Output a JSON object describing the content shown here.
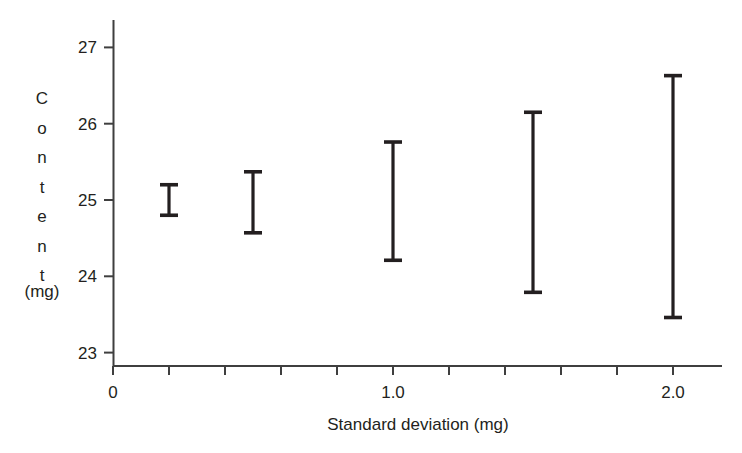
{
  "chart_data": {
    "type": "errorbar",
    "title": "",
    "subtitle": "",
    "xlabel": "Standard deviation (mg)",
    "ylabel": "Content",
    "ylabel_units": "(mg)",
    "ylabel_letters": [
      "C",
      "o",
      "n",
      "t",
      "e",
      "n",
      "t"
    ],
    "xlim": [
      0,
      2.2
    ],
    "ylim": [
      22.8,
      27.3
    ],
    "grid": false,
    "legend": null,
    "x_tick_labels": [
      "0",
      "1.0",
      "2.0"
    ],
    "x_tick_label_values": [
      0,
      1.0,
      2.0
    ],
    "x_minor_tick_values": [
      0,
      0.2,
      0.4,
      0.6,
      0.8,
      1.0,
      1.2,
      1.4,
      1.6,
      1.8,
      2.0
    ],
    "y_tick_labels": [
      "23",
      "24",
      "25",
      "26",
      "27"
    ],
    "y_tick_values": [
      23,
      24,
      25,
      26,
      27
    ],
    "x": [
      0.2,
      0.5,
      1.0,
      1.5,
      2.0
    ],
    "lower": [
      24.8,
      24.57,
      24.21,
      23.79,
      23.46
    ],
    "upper": [
      25.2,
      25.37,
      25.76,
      26.15,
      26.63
    ],
    "center": [
      25.0,
      24.97,
      24.99,
      24.97,
      25.05
    ],
    "series": [
      {
        "name": "Content interval",
        "points": [
          {
            "sd": 0.2,
            "low": 24.8,
            "high": 25.2
          },
          {
            "sd": 0.5,
            "low": 24.57,
            "high": 25.37
          },
          {
            "sd": 1.0,
            "low": 24.21,
            "high": 25.76
          },
          {
            "sd": 1.5,
            "low": 23.79,
            "high": 26.15
          },
          {
            "sd": 2.0,
            "low": 23.46,
            "high": 26.63
          }
        ]
      }
    ],
    "colors": {
      "ink": "#231f20",
      "axis": "#3f3f3f",
      "background": "#ffffff"
    }
  }
}
